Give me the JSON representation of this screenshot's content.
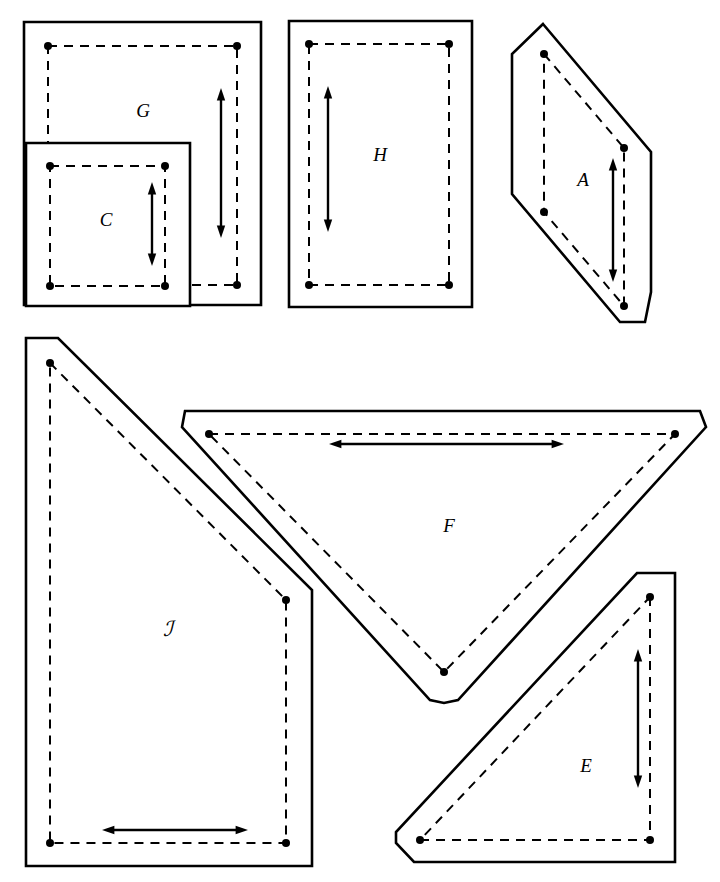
{
  "figure": {
    "background_color": "#ffffff",
    "line_color": "#000000",
    "width": 720,
    "height": 882
  },
  "pieces": [
    {
      "id": "G",
      "label": "G",
      "shape_type": "rectangle",
      "label_position": {
        "x": 143,
        "y": 113
      },
      "outline_points": "24,22 261,22 261,305 24,305",
      "seam_points": "48,46 237,46 237,285 48,285",
      "dots": [
        {
          "x": 48,
          "y": 46
        },
        {
          "x": 237,
          "y": 46
        },
        {
          "x": 237,
          "y": 285
        },
        {
          "x": 48,
          "y": 285
        }
      ],
      "grain_arrow": {
        "orientation": "vertical",
        "x1": 221,
        "y1": 96,
        "x2": 221,
        "y2": 230
      }
    },
    {
      "id": "C",
      "label": "C",
      "shape_type": "rectangle",
      "label_position": {
        "x": 106,
        "y": 222
      },
      "outline_points": "26,143 190,143 190,306 26,306",
      "seam_points": "50,166 165,166 165,286 50,286",
      "dots": [
        {
          "x": 50,
          "y": 166
        },
        {
          "x": 165,
          "y": 166
        },
        {
          "x": 165,
          "y": 286
        },
        {
          "x": 50,
          "y": 286
        }
      ],
      "grain_arrow": {
        "orientation": "vertical",
        "x1": 152,
        "y1": 190,
        "x2": 152,
        "y2": 258
      }
    },
    {
      "id": "H",
      "label": "H",
      "shape_type": "rectangle",
      "label_position": {
        "x": 380,
        "y": 157
      },
      "outline_points": "289,21 472,21 472,307 289,307",
      "seam_points": "309,44 449,44 449,285 309,285",
      "dots": [
        {
          "x": 309,
          "y": 44
        },
        {
          "x": 449,
          "y": 44
        },
        {
          "x": 449,
          "y": 285
        },
        {
          "x": 309,
          "y": 285
        }
      ],
      "grain_arrow": {
        "orientation": "vertical",
        "x1": 328,
        "y1": 94,
        "x2": 328,
        "y2": 224
      }
    },
    {
      "id": "A",
      "label": "A",
      "shape_type": "rhomboid-clipped",
      "label_position": {
        "x": 583,
        "y": 182
      },
      "outline_points": "543,24 651,152 651,292 645,322 620,322 512,194 512,54",
      "seam_points": "544,54 624,148 624,306 544,212",
      "dots": [
        {
          "x": 544,
          "y": 54
        },
        {
          "x": 624,
          "y": 148
        },
        {
          "x": 624,
          "y": 306
        },
        {
          "x": 544,
          "y": 212
        }
      ],
      "grain_arrow": {
        "orientation": "vertical",
        "x1": 613,
        "y1": 166,
        "x2": 613,
        "y2": 274
      }
    },
    {
      "id": "J",
      "label": "ℐ",
      "shape_type": "right-trapezoid",
      "label_position": {
        "x": 168,
        "y": 631
      },
      "outline_points": "26,338 58,338 312,590 312,866 26,866",
      "seam_points": "50,363 286,600 286,843 50,843",
      "dots": [
        {
          "x": 50,
          "y": 363
        },
        {
          "x": 286,
          "y": 600
        },
        {
          "x": 286,
          "y": 843
        },
        {
          "x": 50,
          "y": 843
        }
      ],
      "grain_arrow": {
        "orientation": "horizontal",
        "x1": 110,
        "y1": 830,
        "x2": 240,
        "y2": 830
      }
    },
    {
      "id": "F",
      "label": "F",
      "shape_type": "triangle-down-clipped",
      "label_position": {
        "x": 449,
        "y": 528
      },
      "outline_points": "185,411 700,411 706,427 458,700 444,703 430,700 182,427",
      "seam_points": "209,434 675,434 444,672",
      "dots": [
        {
          "x": 209,
          "y": 434
        },
        {
          "x": 675,
          "y": 434
        },
        {
          "x": 444,
          "y": 672
        }
      ],
      "grain_arrow": {
        "orientation": "horizontal",
        "x1": 337,
        "y1": 444,
        "x2": 556,
        "y2": 444
      }
    },
    {
      "id": "E",
      "label": "E",
      "shape_type": "triangle-right-clipped",
      "label_position": {
        "x": 586,
        "y": 768
      },
      "outline_points": "637,573 675,573 675,862 414,862 396,843 396,832",
      "seam_points": "650,597 650,840 420,840",
      "dots": [
        {
          "x": 650,
          "y": 597
        },
        {
          "x": 650,
          "y": 840
        },
        {
          "x": 420,
          "y": 840
        }
      ],
      "grain_arrow": {
        "orientation": "vertical",
        "x1": 638,
        "y1": 657,
        "x2": 638,
        "y2": 780
      }
    }
  ],
  "style": {
    "outline_stroke_width": 2.6,
    "seam_stroke_width": 2.0,
    "seam_dash_pattern": "9 7",
    "dot_radius": 4.0,
    "arrow_stroke_width": 2.4
  }
}
